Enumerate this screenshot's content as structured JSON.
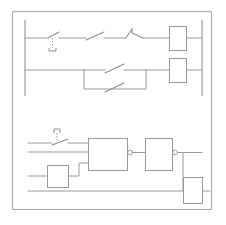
{
  "document": {
    "title": "Electrical Control Schematic",
    "type": "schematic-diagram",
    "background_color": "#ffffff",
    "line_color": "#9a9a9a",
    "frame_color": "#b0b0b0"
  },
  "frame": {
    "label": "diagram-border",
    "x": 12,
    "y": 11,
    "width": 200,
    "height": 199
  },
  "ladder_section": {
    "label": "ladder-logic-section",
    "left_rail": {
      "label": "left-power-rail",
      "x": 25,
      "y_top": 20,
      "y_bottom": 96
    },
    "right_rail": {
      "label": "right-power-rail",
      "x": 202,
      "y_top": 20,
      "y_bottom": 96
    },
    "rungs": [
      {
        "label": "rung-1",
        "y": 38,
        "components": [
          {
            "name": "limit-switch-normally-open",
            "symbol": "switch-with-actuator",
            "x": 48
          },
          {
            "name": "contact-normally-open",
            "symbol": "switch",
            "x": 95
          },
          {
            "name": "contact-normally-closed",
            "symbol": "switch-hooked",
            "x": 133
          },
          {
            "name": "relay-coil-1",
            "symbol": "rectangle-coil",
            "x": 169,
            "width": 17,
            "height": 24
          }
        ]
      },
      {
        "label": "rung-2",
        "y": 70,
        "components": [
          {
            "name": "parallel-branch-upper-contact",
            "symbol": "switch",
            "x": 113
          },
          {
            "name": "parallel-branch-lower-contact",
            "symbol": "switch",
            "x": 113
          },
          {
            "name": "relay-coil-2",
            "symbol": "rectangle-coil",
            "x": 169,
            "width": 17,
            "height": 24
          }
        ]
      }
    ]
  },
  "logic_section": {
    "label": "logic-gate-section",
    "input_lines": [
      {
        "label": "input-line-1",
        "y": 143
      },
      {
        "label": "input-line-2",
        "y": 152
      },
      {
        "label": "input-line-3",
        "y": 163
      },
      {
        "label": "input-line-bottom",
        "y": 190
      }
    ],
    "switch": {
      "name": "input-switch-normally-open",
      "symbol": "switch-with-marker",
      "x": 52,
      "y": 143
    },
    "gates": [
      {
        "name": "logic-gate-1",
        "symbol": "rectangle-gate-inverted-output",
        "x": 88,
        "y": 138,
        "width": 39,
        "height": 32,
        "inputs": 3,
        "output_inverted": true
      },
      {
        "name": "logic-gate-2",
        "symbol": "rectangle-gate-inverted-output",
        "x": 145,
        "y": 138,
        "width": 27,
        "height": 32,
        "inputs": 1,
        "output_inverted": true
      }
    ],
    "blocks": [
      {
        "name": "feedback-block-left",
        "symbol": "rectangle-block",
        "x": 47,
        "y": 168,
        "width": 21,
        "height": 22
      },
      {
        "name": "output-block-right",
        "symbol": "rectangle-block",
        "x": 183,
        "y": 178,
        "width": 19,
        "height": 26
      }
    ]
  }
}
